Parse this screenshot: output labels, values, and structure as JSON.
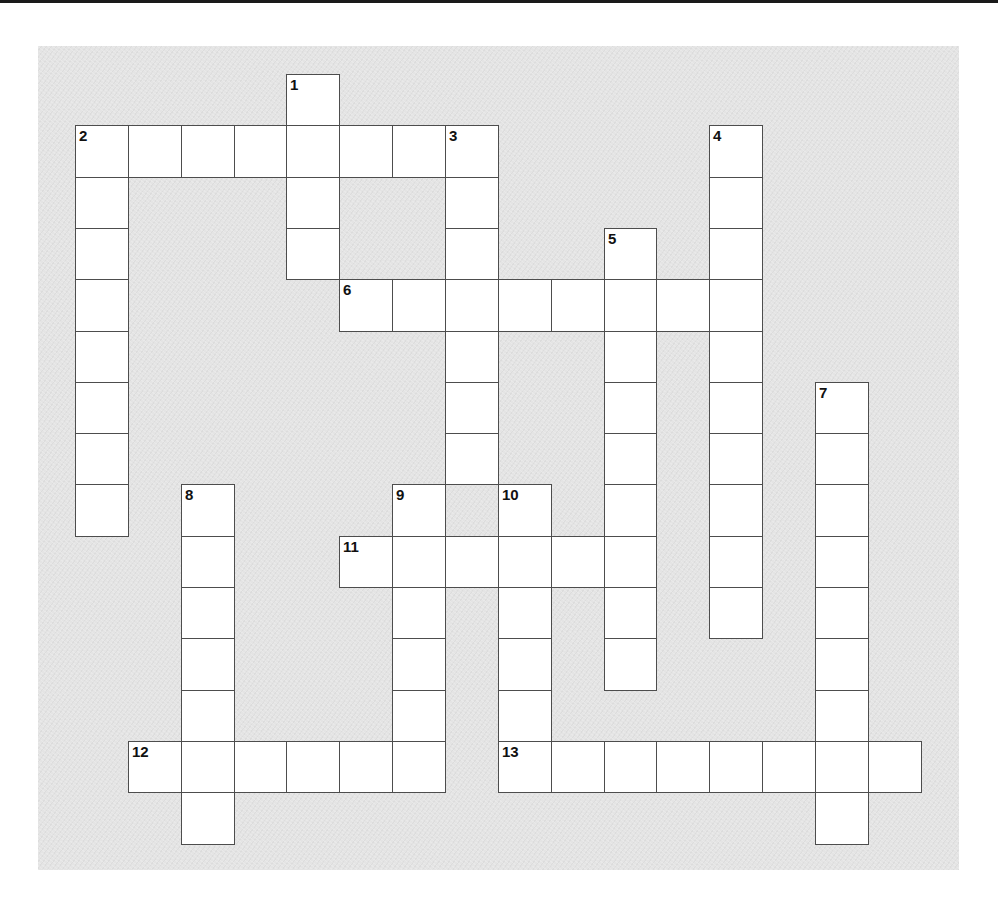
{
  "puzzle": {
    "type": "crossword",
    "layout": {
      "origin_x": 75,
      "origin_y": 74,
      "cell_width": 52.85,
      "cell_height": 51.3
    },
    "colors": {
      "page_background": "#ffffff",
      "puzzle_background": "#e4e4e4",
      "cell_fill": "#ffffff",
      "grid_line": "#4d4d4d",
      "number_text": "#111111",
      "top_rule": "#1a1a1a"
    },
    "entries": [
      {
        "number": "1",
        "direction": "down",
        "row": 0,
        "col": 4,
        "length": 4
      },
      {
        "number": "2",
        "direction": "across",
        "row": 1,
        "col": 0,
        "length": 8
      },
      {
        "number": "2",
        "direction": "down",
        "row": 1,
        "col": 0,
        "length": 8
      },
      {
        "number": "3",
        "direction": "down",
        "row": 1,
        "col": 7,
        "length": 7
      },
      {
        "number": "4",
        "direction": "down",
        "row": 1,
        "col": 12,
        "length": 10
      },
      {
        "number": "5",
        "direction": "down",
        "row": 3,
        "col": 10,
        "length": 9
      },
      {
        "number": "6",
        "direction": "across",
        "row": 4,
        "col": 5,
        "length": 8
      },
      {
        "number": "7",
        "direction": "down",
        "row": 6,
        "col": 14,
        "length": 9
      },
      {
        "number": "8",
        "direction": "down",
        "row": 8,
        "col": 2,
        "length": 7
      },
      {
        "number": "9",
        "direction": "down",
        "row": 8,
        "col": 6,
        "length": 6
      },
      {
        "number": "10",
        "direction": "down",
        "row": 8,
        "col": 8,
        "length": 6
      },
      {
        "number": "11",
        "direction": "across",
        "row": 9,
        "col": 5,
        "length": 6
      },
      {
        "number": "12",
        "direction": "across",
        "row": 13,
        "col": 1,
        "length": 6
      },
      {
        "number": "13",
        "direction": "across",
        "row": 13,
        "col": 8,
        "length": 8
      }
    ],
    "numbered_cells": [
      {
        "number": "1",
        "row": 0,
        "col": 4
      },
      {
        "number": "2",
        "row": 1,
        "col": 0
      },
      {
        "number": "3",
        "row": 1,
        "col": 7
      },
      {
        "number": "4",
        "row": 1,
        "col": 12
      },
      {
        "number": "5",
        "row": 3,
        "col": 10
      },
      {
        "number": "6",
        "row": 4,
        "col": 5
      },
      {
        "number": "7",
        "row": 6,
        "col": 14
      },
      {
        "number": "8",
        "row": 8,
        "col": 2
      },
      {
        "number": "9",
        "row": 8,
        "col": 6
      },
      {
        "number": "10",
        "row": 8,
        "col": 8
      },
      {
        "number": "11",
        "row": 9,
        "col": 5
      },
      {
        "number": "12",
        "row": 13,
        "col": 1
      },
      {
        "number": "13",
        "row": 13,
        "col": 8
      }
    ]
  }
}
